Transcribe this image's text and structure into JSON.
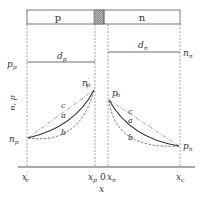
{
  "diagram": {
    "regions": {
      "p_label": "p",
      "n_label": "n"
    },
    "levels": {
      "pp": "p",
      "pp_sub": "p",
      "nn": "n",
      "nn_sub": "n",
      "dp": "d",
      "dp_sub": "p",
      "dn": "d",
      "dn_sub": "n"
    },
    "points": {
      "np_prime": "n",
      "np_prime_sub": "p",
      "pn_prime": "p",
      "pn_prime_sub": "n",
      "np": "n",
      "np_sub": "p",
      "pn": "p",
      "pn_sub": "n"
    },
    "curves": {
      "a": "a",
      "b": "b",
      "c": "c"
    },
    "axis": {
      "y_label": "n, p",
      "x_label": "x",
      "ticks": [
        {
          "main": "x",
          "sub": "c",
          "prime": "′"
        },
        {
          "main": "x",
          "sub": "p",
          "prime": ""
        },
        {
          "main": "0",
          "sub": "",
          "prime": ""
        },
        {
          "main": "x",
          "sub": "n",
          "prime": ""
        },
        {
          "main": "x",
          "sub": "c",
          "prime": ""
        }
      ]
    }
  }
}
